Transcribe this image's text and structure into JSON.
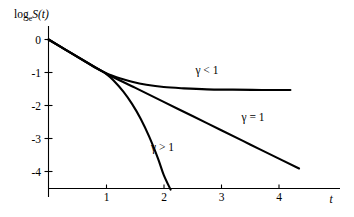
{
  "chart_data": {
    "type": "line",
    "title": "",
    "subtitle": "",
    "xlabel": "t",
    "ylabel": "log_e S(t)",
    "ylabel_parts": {
      "log": "log",
      "sub": "e",
      "func": "S(t)"
    },
    "xlim": [
      0,
      4.9
    ],
    "ylim": [
      -4.55,
      0.25
    ],
    "grid": false,
    "legend_position": "inline-annotations",
    "x_ticks": [
      "1",
      "2",
      "3",
      "4"
    ],
    "x_tick_values": [
      1,
      2,
      3,
      4
    ],
    "y_ticks": [
      "0",
      "-1",
      "-2",
      "-3",
      "-4"
    ],
    "y_tick_values": [
      0,
      -1,
      -2,
      -3,
      -4
    ],
    "annotations": [
      {
        "text": "γ < 1",
        "x": 2.55,
        "y": -1.04
      },
      {
        "text": "γ = 1",
        "x": 3.35,
        "y": -2.46
      },
      {
        "text": "γ > 1",
        "x": 1.78,
        "y": -3.38
      }
    ],
    "series": [
      {
        "name": "γ < 1",
        "label": "γ < 1",
        "x": [
          0,
          0.2,
          0.4,
          0.6,
          0.8,
          1.0,
          1.1,
          1.25,
          1.45,
          1.7,
          2.0,
          2.35,
          2.75,
          3.2,
          3.7,
          4.2
        ],
        "y": [
          0,
          -0.21,
          -0.42,
          -0.63,
          -0.84,
          -1.02,
          -1.09,
          -1.18,
          -1.28,
          -1.37,
          -1.44,
          -1.48,
          -1.51,
          -1.52,
          -1.53,
          -1.53
        ]
      },
      {
        "name": "γ = 1",
        "label": "γ = 1",
        "x": [
          0,
          0.5,
          1.0,
          1.5,
          2.0,
          2.5,
          3.0,
          3.5,
          4.0,
          4.35
        ],
        "y": [
          0,
          -0.52,
          -1.03,
          -1.46,
          -1.89,
          -2.32,
          -2.75,
          -3.18,
          -3.61,
          -3.91
        ]
      },
      {
        "name": "γ > 1",
        "label": "γ > 1",
        "x": [
          0,
          0.25,
          0.5,
          0.75,
          1.0,
          1.15,
          1.3,
          1.45,
          1.6,
          1.75,
          1.9,
          2.0,
          2.12
        ],
        "y": [
          0,
          -0.26,
          -0.52,
          -0.78,
          -1.04,
          -1.28,
          -1.58,
          -1.95,
          -2.4,
          -2.95,
          -3.6,
          -4.1,
          -4.55
        ]
      }
    ]
  },
  "axis_labels": {
    "y_axis_caption": "log_e S(t)",
    "x_axis_caption": "t"
  }
}
